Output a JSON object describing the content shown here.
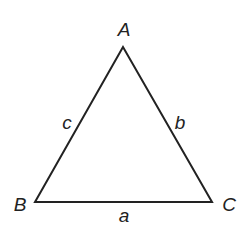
{
  "diagram": {
    "type": "triangle",
    "vertices": [
      {
        "name": "A",
        "x": 123,
        "y": 47
      },
      {
        "name": "B",
        "x": 35,
        "y": 202
      },
      {
        "name": "C",
        "x": 212,
        "y": 202
      }
    ],
    "vertex_labels": {
      "A": "A",
      "B": "B",
      "C": "C"
    },
    "side_labels": {
      "a": "a",
      "b": "b",
      "c": "c"
    },
    "stroke_color": "#222222",
    "background": "#ffffff"
  }
}
